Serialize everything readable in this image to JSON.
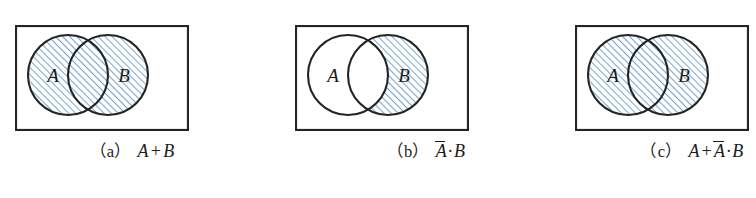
{
  "figure": {
    "background_color": "#ffffff",
    "outline_color": "#242424",
    "hatch_color": "#6f9fd0",
    "hatch_fill_color": "#ffffff",
    "label_color": "#1c1c1c",
    "circle_labels": {
      "left": "A",
      "right": "B"
    }
  },
  "panels": [
    {
      "tag": "(a)",
      "expression_plain": "A + B",
      "expr": {
        "term1": "A",
        "operator": "+",
        "term2": "B"
      },
      "circle_a_label": "A",
      "circle_b_label": "B",
      "shading": {
        "circle_a_only": "hatched",
        "intersection": "hatched",
        "circle_b_only": "hatched",
        "outside": "white"
      }
    },
    {
      "tag": "(b)",
      "expression_plain": "Ā·B",
      "expr": {
        "term1": "A",
        "term1_overline": true,
        "operator": "·",
        "term2": "B"
      },
      "circle_a_label": "A",
      "circle_b_label": "B",
      "shading": {
        "circle_a_only": "white",
        "intersection": "white",
        "circle_b_only": "hatched",
        "outside": "white"
      }
    },
    {
      "tag": "(c)",
      "expression_plain": "A + Ā·B",
      "expr": {
        "term1": "A",
        "operator": "+",
        "term2": "A",
        "term2_overline": true,
        "operator2": "·",
        "term3": "B"
      },
      "circle_a_label": "A",
      "circle_b_label": "B",
      "shading": {
        "circle_a_only": "hatched",
        "intersection": "hatched",
        "circle_b_only": "hatched",
        "outside": "white"
      }
    }
  ]
}
